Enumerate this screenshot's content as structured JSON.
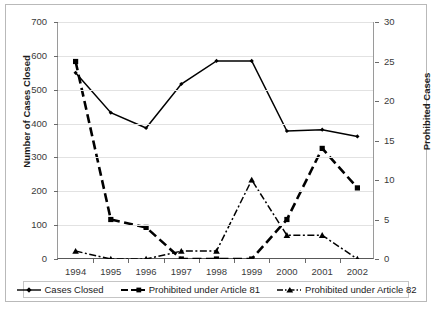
{
  "chart_data": {
    "type": "line",
    "title": "",
    "subtitle": "",
    "xlabel": "",
    "categories": [
      "1994",
      "1995",
      "1996",
      "1997",
      "1998",
      "1999",
      "2000",
      "2001",
      "2002"
    ],
    "grid": true,
    "legend_position": "bottom",
    "axes": {
      "left": {
        "label": "Number of Cases Closed",
        "min": 0,
        "max": 700,
        "step": 100,
        "ticks": [
          "0",
          "100",
          "200",
          "300",
          "400",
          "500",
          "600",
          "700"
        ]
      },
      "right": {
        "label": "Prohibited Cases",
        "min": 0,
        "max": 30,
        "step": 5,
        "ticks": [
          "0",
          "5",
          "10",
          "15",
          "20",
          "25",
          "30"
        ]
      }
    },
    "series": [
      {
        "name": "Cases Closed",
        "axis": "left",
        "line_style": "solid",
        "marker": "small-diamond",
        "color": "#000000",
        "values": [
          550,
          432,
          387,
          517,
          585,
          585,
          378,
          382,
          362
        ]
      },
      {
        "name": "Prohibited under Article 81",
        "axis": "right",
        "line_style": "dashed",
        "marker": "square",
        "color": "#000000",
        "values": [
          25,
          5,
          4,
          0,
          0,
          0,
          5,
          14,
          9
        ]
      },
      {
        "name": "Prohibited under Article 82",
        "axis": "right",
        "line_style": "dash-dot",
        "marker": "triangle",
        "color": "#000000",
        "values": [
          1,
          0,
          0,
          1,
          1,
          10,
          3,
          3,
          0
        ]
      }
    ]
  },
  "legend": {
    "items": [
      {
        "label": "Cases Closed",
        "icon": "line-diamond-marker-icon"
      },
      {
        "label": "Prohibited under Article 81",
        "icon": "line-square-marker-icon"
      },
      {
        "label": "Prohibited under Article 82",
        "icon": "line-triangle-marker-icon"
      }
    ]
  }
}
